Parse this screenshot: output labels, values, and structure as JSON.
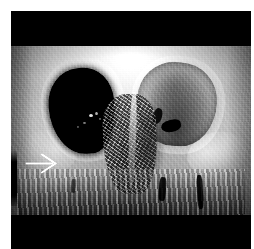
{
  "figure": {
    "kind": "medical-ct-3d-volume-rendering",
    "modality": "CT",
    "view": "anterior-frontal-facial-skeleton",
    "alt": "Three-dimensional CT volume-rendered reconstruction of the facial skeleton viewed from the front, showing both orbits, the nasal aperture with turbinates, the maxilla and dentition; a white arrow on the left side of the image points toward the patient's right orbital region.",
    "background_color": "#ffffff",
    "letterbox_color": "#000000",
    "render_tone": "grayscale"
  },
  "annotations": [
    {
      "id": "arrow-1",
      "type": "arrow",
      "label": "",
      "color": "#ffffff",
      "direction": "right",
      "points_to": "right-orbit-floor-defect"
    }
  ],
  "anatomy": {
    "left_orbit_label": "orbital cavity (dark)",
    "right_orbit_label": "orbital cavity (bony detail)",
    "nasal_label": "nasal aperture and turbinates",
    "maxilla_label": "maxilla and dentition"
  }
}
